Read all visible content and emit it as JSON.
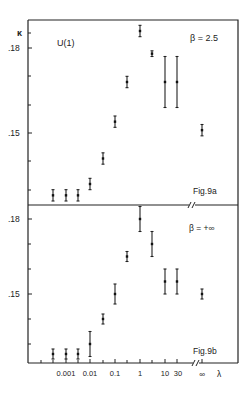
{
  "chart_data": [
    {
      "type": "scatter",
      "panel": "top",
      "figure_label": "Fig.9a",
      "title": "U(1)",
      "annotation": "β = 2.5",
      "ylabel": "κ",
      "xlabel": "λ",
      "x_scale": "log",
      "y_ticks": [
        ".18",
        ".15"
      ],
      "y_tick_values": [
        0.18,
        0.15
      ],
      "ylim": [
        0.124,
        0.19
      ],
      "x": [
        "0.0003",
        "0.001",
        "0.003",
        "0.01",
        "0.03",
        "0.1",
        "0.3",
        "1",
        "3",
        "10",
        "30",
        "∞"
      ],
      "values": [
        0.128,
        0.128,
        0.128,
        0.132,
        0.141,
        0.154,
        0.168,
        0.186,
        0.178,
        0.168,
        0.168,
        0.151
      ],
      "errors": [
        0.002,
        0.002,
        0.002,
        0.002,
        0.002,
        0.002,
        0.002,
        0.002,
        0.001,
        0.009,
        0.009,
        0.002
      ]
    },
    {
      "type": "scatter",
      "panel": "bottom",
      "figure_label": "Fig.9b",
      "annotation": "β = +∞",
      "ylabel": "κ",
      "xlabel": "λ",
      "x_scale": "log",
      "y_ticks": [
        ".18",
        ".15"
      ],
      "y_tick_values": [
        0.18,
        0.15
      ],
      "ylim": [
        0.124,
        0.186
      ],
      "x_tick_labels": [
        "0.001",
        "0.01",
        "0.1",
        "1",
        "10",
        "30",
        "∞",
        "λ"
      ],
      "x": [
        "0.0003",
        "0.001",
        "0.003",
        "0.01",
        "0.03",
        "0.1",
        "0.3",
        "1",
        "3",
        "10",
        "30",
        "∞"
      ],
      "values": [
        0.126,
        0.126,
        0.126,
        0.13,
        0.14,
        0.15,
        0.165,
        0.18,
        0.17,
        0.155,
        0.155,
        0.15
      ],
      "errors": [
        0.002,
        0.002,
        0.002,
        0.005,
        0.002,
        0.004,
        0.002,
        0.005,
        0.005,
        0.005,
        0.005,
        0.002
      ]
    }
  ],
  "labels": {
    "top_ylabel": "κ",
    "top_title": "U(1)",
    "top_beta": "β = 2.5",
    "top_fig": "Fig.9a",
    "top_tick_18": ".18",
    "top_tick_15": ".15",
    "bottom_beta": "β = +∞",
    "bottom_fig": "Fig.9b",
    "bottom_tick_18": ".18",
    "bottom_tick_15": ".15",
    "x_0001": "0.001",
    "x_001": "0.01",
    "x_01": "0.1",
    "x_1": "1",
    "x_10": "10",
    "x_30": "30",
    "x_inf": "∞",
    "x_lambda": "λ"
  }
}
